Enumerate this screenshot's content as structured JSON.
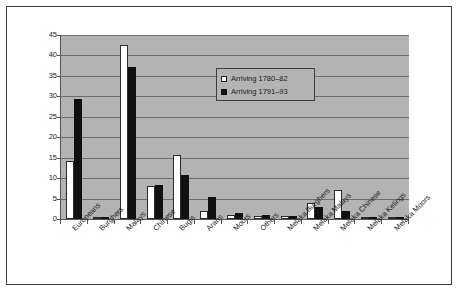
{
  "chart_data": {
    "type": "bar",
    "title": "",
    "xlabel": "",
    "ylabel": "",
    "ylim": [
      0,
      45
    ],
    "ytick_step": 5,
    "yticks": [
      "45",
      "40",
      "35",
      "30",
      "25",
      "20",
      "15",
      "10",
      "5",
      "0"
    ],
    "grid": true,
    "legend_position": "inside-top-center",
    "plot_background": "#b3b3b3",
    "categories": [
      "Europeans",
      "Burghers",
      "Malays",
      "Chinese",
      "Bugis",
      "Arabs",
      "Moors",
      "Others",
      "Melaka Burghers",
      "Melaka Malays",
      "Melaka Chinese",
      "Melaka Kelings",
      "Melaka Moors"
    ],
    "series": [
      {
        "name": "Arriving 1780–82",
        "color": "#ffffff",
        "values": [
          14.3,
          0.0,
          42.5,
          8.0,
          15.7,
          2.0,
          1.0,
          0.8,
          0.7,
          4.0,
          7.0,
          0.0,
          0.6
        ]
      },
      {
        "name": "Arriving 1791–93",
        "color": "#101010",
        "values": [
          29.3,
          0.4,
          37.3,
          8.3,
          10.8,
          5.5,
          1.5,
          0.9,
          0.8,
          3.0,
          2.0,
          0.5,
          0.0
        ]
      }
    ]
  },
  "legend": {
    "entries": [
      {
        "label": "Arriving 1780–82",
        "marker": "white-square"
      },
      {
        "label": "Arriving 1791–93",
        "marker": "black-square"
      }
    ]
  }
}
